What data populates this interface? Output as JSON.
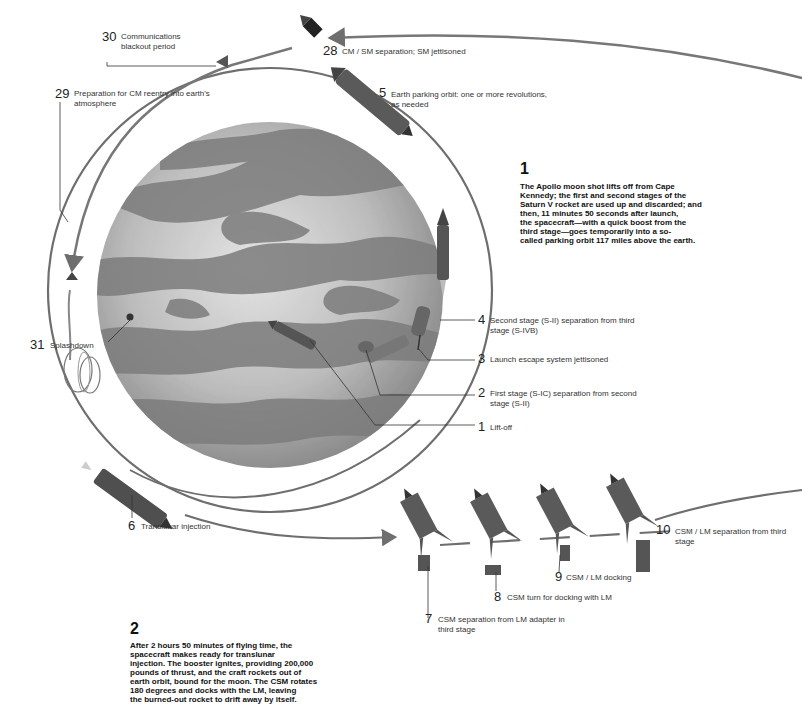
{
  "figure": {
    "type": "illustrated-diagram",
    "colors": {
      "background": "#ffffff",
      "orbit_line": "#6e6e6e",
      "earth_dark": "#7c7c7c",
      "earth_light": "#c9c9c9",
      "text": "#222222",
      "spacecraft": "#555555"
    }
  },
  "paragraphs": [
    {
      "number": "1",
      "text_lines": [
        "The Apollo moon shot lifts off from Cape",
        "Kennedy; the first and second stages of the",
        "Saturn V rocket are used up and discarded; and",
        "then, 11 minutes 50 seconds after launch,",
        "the spacecraft—with a quick boost from the",
        "third stage—goes temporarily into a so-",
        "called parking orbit 117 miles above the earth."
      ]
    },
    {
      "number": "2",
      "text_lines": [
        "After 2 hours 50 minutes of flying time, the",
        "spacecraft makes ready for translunar",
        "injection. The booster ignites, providing 200,000",
        "pounds of thrust, and the craft rockets out of",
        "earth orbit, bound for the moon. The CSM rotates",
        "180 degrees and docks with the LM, leaving",
        "the burned-out rocket to drift away by itself."
      ]
    }
  ],
  "steps": [
    {
      "num": "1",
      "lines": [
        "Lift-off"
      ]
    },
    {
      "num": "2",
      "lines": [
        "First stage (S-IC) separation from second",
        "stage (S-II)"
      ]
    },
    {
      "num": "3",
      "lines": [
        "Launch escape system jettisoned"
      ]
    },
    {
      "num": "4",
      "lines": [
        "Second stage (S-II) separation from third",
        "stage (S-IVB)"
      ]
    },
    {
      "num": "5",
      "lines": [
        "Earth parking orbit: one or more revolutions,",
        "as needed"
      ]
    },
    {
      "num": "6",
      "lines": [
        "Translunar injection"
      ]
    },
    {
      "num": "7",
      "lines": [
        "CSM separation from LM adapter in",
        "third stage"
      ]
    },
    {
      "num": "8",
      "lines": [
        "CSM turn for docking with LM"
      ]
    },
    {
      "num": "9",
      "lines": [
        "CSM / LM docking"
      ]
    },
    {
      "num": "10",
      "lines": [
        "CSM / LM separation from third stage"
      ]
    },
    {
      "num": "28",
      "lines": [
        "CM / SM separation; SM jettisoned"
      ]
    },
    {
      "num": "29",
      "lines": [
        "Preparation for CM reentry into earth's",
        "atmosphere"
      ]
    },
    {
      "num": "30",
      "lines": [
        "Communications",
        "blackout period"
      ]
    },
    {
      "num": "31",
      "lines": [
        "Splashdown"
      ]
    }
  ]
}
